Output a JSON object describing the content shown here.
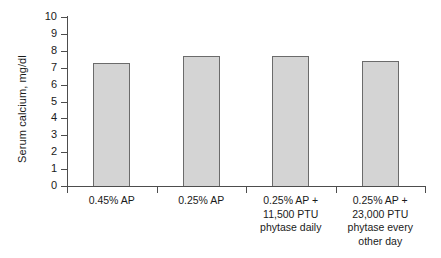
{
  "chart_data": {
    "type": "bar",
    "title": "",
    "xlabel": "",
    "ylabel": "Serum calcium, mg/dl",
    "ylim": [
      0,
      10
    ],
    "ytick_labels": [
      "10",
      "9",
      "8",
      "7",
      "6",
      "5",
      "4",
      "3",
      "2",
      "1",
      "0"
    ],
    "ytick_values": [
      10,
      9,
      8,
      7,
      6,
      5,
      4,
      3,
      2,
      1,
      0
    ],
    "grid": false,
    "legend": false,
    "categories": [
      "0.45% AP",
      "0.25% AP",
      "0.25% AP +\n11,500 PTU\nphytase daily",
      "0.25% AP +\n23,000 PTU\nphytase every\nother day"
    ],
    "values": [
      7.3,
      7.7,
      7.7,
      7.4
    ],
    "bar_color": "#d4d4d4",
    "bar_edge_color": "#6b6b6b",
    "axis_color": "#4d4d4d"
  }
}
